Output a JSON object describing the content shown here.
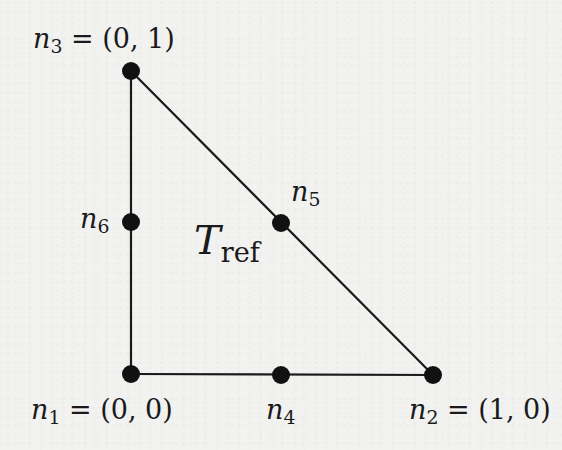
{
  "diagram": {
    "element_label": {
      "symbol": "T",
      "subscript": "ref"
    },
    "colors": {
      "background": "#f2f2f1",
      "lines": "#1a1a1a",
      "nodes": "#111111"
    },
    "nodes": [
      {
        "id": "n1",
        "symbol": "n",
        "index": "1",
        "coords": "(0, 0)",
        "suffix": " = (0, 0)",
        "role": "vertex",
        "px": [
          131,
          374
        ]
      },
      {
        "id": "n2",
        "symbol": "n",
        "index": "2",
        "coords": "(1, 0)",
        "suffix": " = (1, 0)",
        "role": "vertex",
        "px": [
          433,
          375
        ]
      },
      {
        "id": "n3",
        "symbol": "n",
        "index": "3",
        "coords": "(0, 1)",
        "suffix": " = (0, 1)",
        "role": "vertex",
        "px": [
          131,
          71
        ]
      },
      {
        "id": "n4",
        "symbol": "n",
        "index": "4",
        "coords": "",
        "suffix": "",
        "role": "edge-midpoint",
        "px": [
          281,
          375
        ]
      },
      {
        "id": "n5",
        "symbol": "n",
        "index": "5",
        "coords": "",
        "suffix": "",
        "role": "edge-midpoint",
        "px": [
          281,
          223
        ]
      },
      {
        "id": "n6",
        "symbol": "n",
        "index": "6",
        "coords": "",
        "suffix": "",
        "role": "edge-midpoint",
        "px": [
          131,
          222
        ]
      }
    ],
    "edges": [
      {
        "from": "n1",
        "to": "n2"
      },
      {
        "from": "n2",
        "to": "n3"
      },
      {
        "from": "n3",
        "to": "n1"
      }
    ]
  }
}
